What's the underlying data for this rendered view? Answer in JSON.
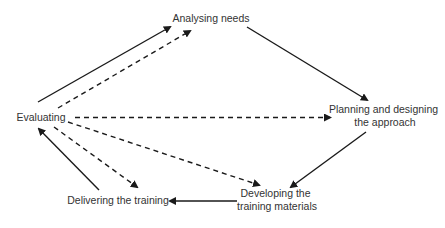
{
  "diagram": {
    "type": "training-cycle",
    "nodes": [
      {
        "id": "analysing",
        "lines": [
          "Analysing needs"
        ],
        "x": 211,
        "y": 22
      },
      {
        "id": "planning",
        "lines": [
          "Planning and designing",
          "the approach"
        ],
        "x": 385,
        "y": 113
      },
      {
        "id": "developing",
        "lines": [
          "Developing the",
          "training materials"
        ],
        "x": 277,
        "y": 197
      },
      {
        "id": "delivering",
        "lines": [
          "Delivering the training"
        ],
        "x": 118,
        "y": 203
      },
      {
        "id": "evaluating",
        "lines": [
          "Evaluating"
        ],
        "x": 41,
        "y": 121
      }
    ],
    "edges": [
      {
        "from": "evaluating",
        "to": "analysing",
        "style": "solid"
      },
      {
        "from": "evaluating",
        "to": "analysing",
        "style": "dashed"
      },
      {
        "from": "analysing",
        "to": "planning",
        "style": "solid"
      },
      {
        "from": "evaluating",
        "to": "planning",
        "style": "dashed"
      },
      {
        "from": "evaluating",
        "to": "developing",
        "style": "dashed"
      },
      {
        "from": "evaluating",
        "to": "delivering",
        "style": "dashed"
      },
      {
        "from": "planning",
        "to": "developing",
        "style": "solid"
      },
      {
        "from": "developing",
        "to": "delivering",
        "style": "solid"
      },
      {
        "from": "delivering",
        "to": "evaluating",
        "style": "solid"
      }
    ],
    "colors": {
      "line": "#1a1a1a",
      "text": "#333333",
      "background": "#ffffff"
    }
  }
}
